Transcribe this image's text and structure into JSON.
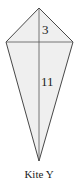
{
  "diagram": {
    "shape": "kite",
    "title": "Kite Y",
    "fill_color": "#efefef",
    "stroke_color": "#333333",
    "vertices": {
      "top": [
        39,
        8
      ],
      "left": [
        6,
        42
      ],
      "right": [
        73,
        42
      ],
      "bottom": [
        39,
        161
      ]
    },
    "labels": {
      "upper_segment": "3",
      "lower_segment": "11"
    }
  }
}
